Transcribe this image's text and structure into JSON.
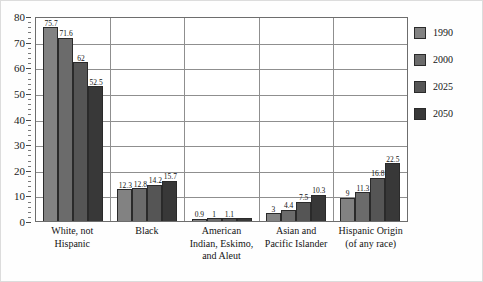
{
  "chart_data": {
    "type": "bar",
    "title": "",
    "subtitle": "",
    "xlabel": "",
    "ylabel": "",
    "ylim": [
      0,
      80
    ],
    "y_ticks": [
      0,
      10,
      20,
      30,
      40,
      50,
      60,
      70,
      80
    ],
    "y_tick_labels": [
      "0",
      "10",
      "20",
      "30",
      "40",
      "50",
      "60",
      "70",
      "80"
    ],
    "y_minor_tick_step": 2,
    "grid": "horizontal",
    "legend_position": "right",
    "categories": [
      "White, not Hispanic",
      "Black",
      "American Indian, Eskimo, and Aleut",
      "Asian and Pacific Islander",
      "Hispanic Origin (of any race)"
    ],
    "category_label_lines": [
      [
        "White, not",
        "Hispanic"
      ],
      [
        "Black"
      ],
      [
        "American",
        "Indian, Eskimo,",
        "and Aleut"
      ],
      [
        "Asian and",
        "Pacific Islander"
      ],
      [
        "Hispanic Origin",
        "(of any race)"
      ]
    ],
    "series": [
      {
        "name": "1990",
        "color": "#828282",
        "values": [
          75.7,
          12.3,
          0.9,
          3,
          9
        ],
        "labels": [
          "75.7",
          "12.3",
          "0.9",
          "3",
          "9"
        ]
      },
      {
        "name": "2000",
        "color": "#6b6b6b",
        "values": [
          71.6,
          12.8,
          1,
          4.4,
          11.3
        ],
        "labels": [
          "71.6",
          "12.8",
          "1",
          "4.4",
          "11.3"
        ]
      },
      {
        "name": "2025",
        "color": "#555555",
        "values": [
          62,
          14.2,
          1.1,
          7.5,
          16.8
        ],
        "labels": [
          "62",
          "14.2",
          "1.1",
          "7.5",
          "16.8"
        ]
      },
      {
        "name": "2050",
        "color": "#383838",
        "values": [
          52.5,
          15.7,
          1.2,
          10.3,
          22.5
        ],
        "labels": [
          "52.5",
          "15.7",
          "",
          "10.3",
          "22.5"
        ]
      }
    ]
  },
  "legend": {
    "entries": [
      {
        "label": "1990",
        "color": "#828282"
      },
      {
        "label": "2000",
        "color": "#6b6b6b"
      },
      {
        "label": "2025",
        "color": "#555555"
      },
      {
        "label": "2050",
        "color": "#383838"
      }
    ]
  }
}
